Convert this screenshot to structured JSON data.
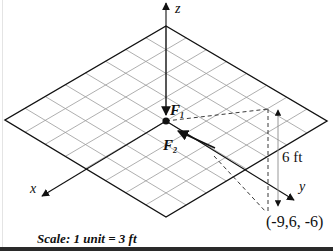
{
  "figure": {
    "axes": {
      "x_label": "x",
      "y_label": "y",
      "z_label": "z"
    },
    "forces": [
      {
        "name": "F",
        "subscript": "1",
        "direction": "down along -z"
      },
      {
        "name": "F",
        "subscript": "2",
        "direction": "toward origin from point (-9,6,-6)"
      }
    ],
    "dimension_label": "6 ft",
    "point_label": "(-9,6, -6)",
    "scale_label": "Scale: 1 unit = 3 ft",
    "grid": {
      "cells_per_side": 8
    },
    "colors": {
      "line": "#111111",
      "grid": "#9a9a9a",
      "dim_line": "#8c8c8c"
    }
  }
}
